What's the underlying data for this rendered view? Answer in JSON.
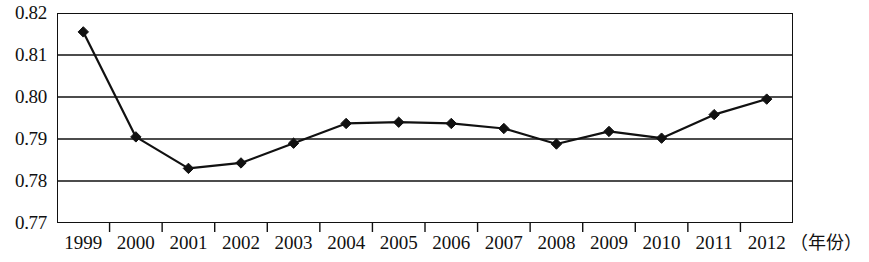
{
  "chart_data": {
    "type": "line",
    "title": "",
    "subtitle": "",
    "xlabel": "（年份）",
    "ylabel": "",
    "grid": true,
    "legend": "none",
    "ylim": [
      0.77,
      0.82
    ],
    "ytick_labels": [
      "0.82",
      "0.81",
      "0.80",
      "0.79",
      "0.78",
      "0.77"
    ],
    "ytick_values": [
      0.82,
      0.81,
      0.8,
      0.79,
      0.78,
      0.77
    ],
    "categories": [
      "1999",
      "2000",
      "2001",
      "2002",
      "2003",
      "2004",
      "2005",
      "2006",
      "2007",
      "2008",
      "2009",
      "2010",
      "2011",
      "2012"
    ],
    "series": [
      {
        "name": "",
        "marker": "diamond",
        "color": "#111111",
        "values": [
          0.8155,
          0.7905,
          0.783,
          0.7843,
          0.789,
          0.7937,
          0.794,
          0.7937,
          0.7925,
          0.7888,
          0.7918,
          0.7902,
          0.7958,
          0.7995
        ]
      }
    ]
  },
  "axis": {
    "unit_label": "（年份）"
  }
}
